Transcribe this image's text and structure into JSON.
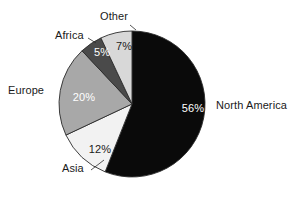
{
  "chart_data": {
    "type": "pie",
    "title": "",
    "subtitle": "",
    "xlabel": "",
    "ylabel": "",
    "legend_position": "none",
    "grid": false,
    "start_angle_deg": 0,
    "direction": "clockwise",
    "categories": [
      "North America",
      "Asia",
      "Europe",
      "Africa",
      "Other"
    ],
    "values": [
      56,
      12,
      20,
      5,
      7
    ],
    "value_unit": "%",
    "value_labels": [
      "56%",
      "12%",
      "20%",
      "5%",
      "7%"
    ],
    "colors": [
      "#0a0a0a",
      "#f2f2f2",
      "#a8a8a8",
      "#4a4a4a",
      "#d8d8d8"
    ],
    "slices": [
      {
        "name": "North America",
        "value": 56,
        "value_label": "56%",
        "color": "#0a0a0a",
        "value_text_color": "#ffffff",
        "label_text_color": "#1a1a1a",
        "start_deg": 0,
        "end_deg": 201.6
      },
      {
        "name": "Asia",
        "value": 12,
        "value_label": "12%",
        "color": "#f2f2f2",
        "value_text_color": "#1a1a1a",
        "label_text_color": "#1a1a1a",
        "start_deg": 201.6,
        "end_deg": 244.8
      },
      {
        "name": "Europe",
        "value": 20,
        "value_label": "20%",
        "color": "#a8a8a8",
        "value_text_color": "#ffffff",
        "label_text_color": "#1a1a1a",
        "start_deg": 244.8,
        "end_deg": 316.8
      },
      {
        "name": "Africa",
        "value": 5,
        "value_label": "5%",
        "color": "#4a4a4a",
        "value_text_color": "#ffffff",
        "label_text_color": "#1a1a1a",
        "start_deg": 316.8,
        "end_deg": 334.8
      },
      {
        "name": "Other",
        "value": 7,
        "value_label": "7%",
        "color": "#d8d8d8",
        "value_text_color": "#1a1a1a",
        "label_text_color": "#1a1a1a",
        "start_deg": 334.8,
        "end_deg": 360
      }
    ]
  },
  "figure": {
    "background": "#ffffff",
    "outline_color": "#2b2b2b",
    "center_x": 132,
    "center_y": 104,
    "radius": 73
  },
  "labels": {
    "other": "Other",
    "africa": "Africa",
    "europe": "Europe",
    "asia": "Asia",
    "north_america": "North America"
  },
  "values": {
    "other": "7%",
    "africa": "5%",
    "europe": "20%",
    "asia": "12%",
    "north_america": "56%"
  }
}
